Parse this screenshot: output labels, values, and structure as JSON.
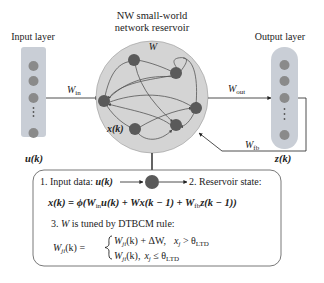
{
  "title": {
    "line1": "NW small-world",
    "line2": "network reservoir"
  },
  "input_layer": {
    "label": "Input layer",
    "vector_label": "u(k)",
    "weight_label": "W",
    "weight_sub": "in",
    "ellipsis": "⋮"
  },
  "reservoir": {
    "matrix_label": "W",
    "state_label": "x(k)"
  },
  "output_layer": {
    "label": "Output layer",
    "vector_label": "z(k)",
    "weight_label": "W",
    "weight_sub": "out",
    "feedback_label": "W",
    "feedback_sub": "fb",
    "ellipsis": "⋮"
  },
  "process_box": {
    "step1": "1. Input data: ",
    "step1_var": "u(k)",
    "step2": "2. Reservoir state:",
    "equation": "x(k) = ϕ(W",
    "equation_parts": {
      "p1": "x(k) = ϕ(W",
      "p1_sub": "in",
      "p2": "u(k) + Wx(k − 1) + W",
      "p2_sub": "fb",
      "p3": "z(k − 1))"
    },
    "step3_prefix": "3. ",
    "step3_var": "W",
    "step3_text": " is tuned by DTBCM rule:",
    "rule_lhs": "W",
    "rule_lhs_sub": "ji",
    "rule_lhs_tail": "(k) =",
    "case1_expr": "W",
    "case1_sub": "ji",
    "case1_tail": "(k) + ΔW,",
    "case1_cond": "x",
    "case1_cond_sub": "j",
    "case1_op": " > θ",
    "case1_theta_sub": "LTD",
    "case2_expr": "W",
    "case2_sub": "ji",
    "case2_tail": "(k),",
    "case2_cond": "x",
    "case2_cond_sub": "j",
    "case2_op": " ≤ θ",
    "case2_theta_sub": "LTD"
  },
  "colors": {
    "layer_fill": "#c9ced6",
    "node_fill": "#7e7e7e",
    "reservoir_fill": "#d4d4d4",
    "reservoir_node": "#5a5a5a",
    "line": "#333333"
  }
}
